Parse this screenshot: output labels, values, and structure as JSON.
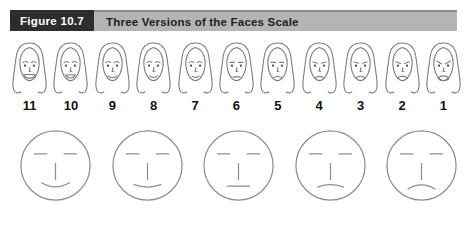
{
  "header": {
    "figure_label": "Figure 10.7",
    "title": "Three Versions of the Faces Scale"
  },
  "colors": {
    "header_label_bg": "#2d2d2d",
    "header_label_text": "#ffffff",
    "header_bar_bg": "#b4b4b4",
    "header_bar_text": "#1f1f1f",
    "face_line": "#7d7d7d",
    "eye_dot": "#4f4f4f",
    "circle_line": "#8f8f8f",
    "number_color": "#111111"
  },
  "top_scale": {
    "description": "numbered faces scale from 11 (happiest) to 1 (angriest)",
    "faces": [
      {
        "value": "11",
        "mouth": "open-smile",
        "brow": "normal"
      },
      {
        "value": "10",
        "mouth": "smile-big",
        "brow": "normal"
      },
      {
        "value": "9",
        "mouth": "smile",
        "brow": "normal"
      },
      {
        "value": "8",
        "mouth": "smile-small",
        "brow": "normal"
      },
      {
        "value": "7",
        "mouth": "smile-slight",
        "brow": "normal"
      },
      {
        "value": "6",
        "mouth": "neutral",
        "brow": "flat"
      },
      {
        "value": "5",
        "mouth": "frown-slight",
        "brow": "flat"
      },
      {
        "value": "4",
        "mouth": "frown-small",
        "brow": "lowered"
      },
      {
        "value": "3",
        "mouth": "frown",
        "brow": "lowered"
      },
      {
        "value": "2",
        "mouth": "frown-big",
        "brow": "angled"
      },
      {
        "value": "1",
        "mouth": "open-frown",
        "brow": "angry"
      }
    ]
  },
  "bottom_scale": {
    "description": "five circle faces from smile to frown",
    "faces": [
      {
        "mouth": "smile-deep"
      },
      {
        "mouth": "smile-slight"
      },
      {
        "mouth": "neutral"
      },
      {
        "mouth": "frown-slight"
      },
      {
        "mouth": "frown-deep"
      }
    ]
  }
}
